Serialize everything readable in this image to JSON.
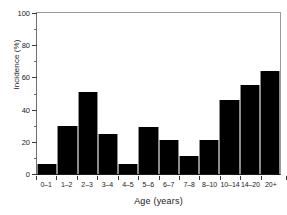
{
  "chart_data": {
    "type": "bar",
    "title": "",
    "xlabel": "Age (years)",
    "ylabel": "Incidence (%)",
    "categories": [
      "0–1",
      "1–2",
      "2–3",
      "3–4",
      "4–5",
      "5–6",
      "6–7",
      "7–8",
      "8–10",
      "10–14",
      "14–20",
      "20+"
    ],
    "values": [
      6,
      30,
      51,
      25,
      6.5,
      29,
      21,
      11,
      21,
      46,
      55,
      64
    ],
    "ylim": [
      0,
      100
    ],
    "yticks": [
      0,
      20,
      40,
      60,
      80,
      100
    ],
    "ytick_labels": [
      "0",
      "20",
      "40",
      "60",
      "80",
      "100"
    ],
    "yminor_ticks": [
      10,
      30,
      50,
      70,
      90
    ],
    "grid": false,
    "legend": null,
    "bar_color": "#000000",
    "axis_color": "#1a1a1a",
    "background": "#ffffff"
  }
}
